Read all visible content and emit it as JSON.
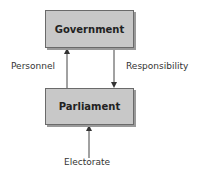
{
  "diagram": {
    "nodes": {
      "government": "Government",
      "parliament": "Parliament"
    },
    "edges": {
      "personnel": "Personnel",
      "responsibility": "Responsibility",
      "electorate": "Electorate"
    }
  }
}
